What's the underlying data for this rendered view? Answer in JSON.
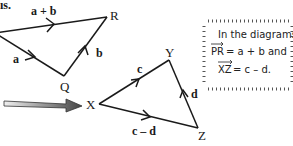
{
  "header_fragment": "ıs.",
  "triangle_pqr": {
    "vertices": {
      "R": "R",
      "Q": "Q"
    },
    "edges": {
      "top": "a + b",
      "left": "a",
      "right": "b"
    }
  },
  "triangle_xyz": {
    "vertices": {
      "X": "X",
      "Y": "Y",
      "Z": "Z"
    },
    "edges": {
      "xy": "c",
      "yz": "d",
      "xz": "c – d"
    }
  },
  "note": {
    "line1": "In the diagrams,",
    "line2_vec": "PR",
    "line2_rest": " = a + b  and",
    "line3_vec": "XZ",
    "line3_rest": " = c – d."
  },
  "colors": {
    "line": "#1a1a1a",
    "arrow_fill": "#555555",
    "border": "#444444"
  }
}
